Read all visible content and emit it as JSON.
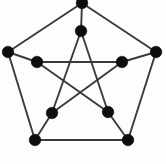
{
  "figure": {
    "name": "petersen-graph",
    "background_color": "#fdfdfd",
    "node_color": "#0d0d0d",
    "edge_color": "#3a3a3a",
    "node_radius": 5.8,
    "edge_width": 1.9,
    "width": 166,
    "height": 164
  },
  "graph": {
    "node_count": 10,
    "edge_count": 15,
    "nodes": [
      {
        "id": "outer-top",
        "label": "",
        "x": 82,
        "y": 3
      },
      {
        "id": "outer-right",
        "label": "",
        "x": 156,
        "y": 52
      },
      {
        "id": "outer-bottom-right",
        "label": "",
        "x": 128,
        "y": 140
      },
      {
        "id": "outer-bottom-left",
        "label": "",
        "x": 35,
        "y": 140
      },
      {
        "id": "outer-left",
        "label": "",
        "x": 8,
        "y": 52
      },
      {
        "id": "inner-top",
        "label": "",
        "x": 81,
        "y": 31
      },
      {
        "id": "inner-right",
        "label": "",
        "x": 122,
        "y": 62
      },
      {
        "id": "inner-bottom-right",
        "label": "",
        "x": 108,
        "y": 112
      },
      {
        "id": "inner-bottom-left",
        "label": "",
        "x": 52,
        "y": 113
      },
      {
        "id": "inner-left",
        "label": "",
        "x": 37,
        "y": 62
      }
    ],
    "edges": [
      {
        "from": "outer-top",
        "to": "outer-right"
      },
      {
        "from": "outer-right",
        "to": "outer-bottom-right"
      },
      {
        "from": "outer-bottom-right",
        "to": "outer-bottom-left"
      },
      {
        "from": "outer-bottom-left",
        "to": "outer-left"
      },
      {
        "from": "outer-left",
        "to": "outer-top"
      },
      {
        "from": "outer-top",
        "to": "inner-top"
      },
      {
        "from": "outer-right",
        "to": "inner-right"
      },
      {
        "from": "outer-bottom-right",
        "to": "inner-bottom-right"
      },
      {
        "from": "outer-bottom-left",
        "to": "inner-bottom-left"
      },
      {
        "from": "outer-left",
        "to": "inner-left"
      },
      {
        "from": "inner-top",
        "to": "inner-bottom-right"
      },
      {
        "from": "inner-bottom-right",
        "to": "inner-left"
      },
      {
        "from": "inner-left",
        "to": "inner-right"
      },
      {
        "from": "inner-right",
        "to": "inner-bottom-left"
      },
      {
        "from": "inner-bottom-left",
        "to": "inner-top"
      }
    ]
  }
}
